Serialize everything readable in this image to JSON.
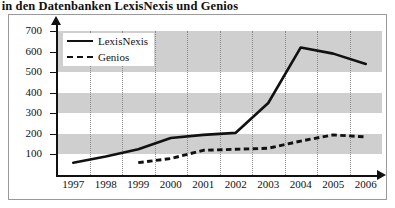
{
  "title": "keit in den Datenbanken LexisNexis und Genios",
  "legend": {
    "lexisnexis_label": "LexisNexis",
    "genios_label": "Genios"
  },
  "chart_data": {
    "type": "line",
    "title": "keit in den Datenbanken LexisNexis und Genios",
    "xlabel": "",
    "ylabel": "",
    "categories": [
      "1997",
      "1998",
      "1999",
      "2000",
      "2001",
      "2002",
      "2003",
      "2004",
      "2005",
      "2006"
    ],
    "yticks": [
      100,
      200,
      300,
      400,
      500,
      600,
      700
    ],
    "ylim": [
      0,
      700
    ],
    "grid": "vertical dotted gridlines with alternating horizontal gray bands",
    "legend_position": "top-left inside plot",
    "series": [
      {
        "name": "LexisNexis",
        "style": "solid",
        "color": "#111111",
        "values": [
          60,
          90,
          125,
          180,
          195,
          205,
          350,
          620,
          590,
          540
        ]
      },
      {
        "name": "Genios",
        "style": "dashed",
        "color": "#111111",
        "values": [
          null,
          null,
          60,
          80,
          120,
          125,
          130,
          165,
          195,
          185
        ]
      }
    ]
  }
}
